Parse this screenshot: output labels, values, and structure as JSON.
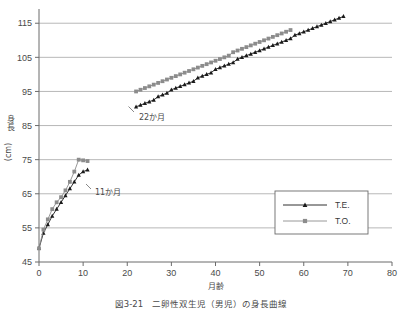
{
  "figure": {
    "caption": "図3-21　二卵性双生児（男児）の身長曲線",
    "annotations": [
      {
        "id": "a22",
        "text": "22か月"
      },
      {
        "id": "a11",
        "text": "11か月"
      }
    ]
  },
  "legend": {
    "position": "bottom-right",
    "items": [
      {
        "label": "T.E.",
        "marker": "triangle",
        "color": "#1a1a1a"
      },
      {
        "label": "T.O.",
        "marker": "square",
        "color": "#8c8c8c"
      }
    ]
  },
  "chart_data": {
    "type": "line",
    "title": "",
    "subtitle": "",
    "xlabel": "月齢",
    "ylabel": "身長（cm）",
    "ylabel_main": "身長",
    "ylabel_unit": "(cm)",
    "xlim": [
      0,
      80
    ],
    "ylim": [
      45,
      118
    ],
    "xticks": [
      0,
      10,
      20,
      30,
      40,
      50,
      60,
      70,
      80
    ],
    "xticklabels": [
      "0",
      "10",
      "20",
      "30",
      "40",
      "50",
      "60",
      "70",
      "80"
    ],
    "yticks": [
      45,
      55,
      65,
      75,
      85,
      95,
      105,
      115
    ],
    "yticklabels": [
      "45",
      "55",
      "65",
      "75",
      "85",
      "95",
      "105",
      "115"
    ],
    "grid": "horizontal",
    "legend_position": "lower right",
    "annotations": [
      {
        "text": "22か月",
        "x": 22,
        "y": 91,
        "note": "arrow points to start of second data block"
      },
      {
        "text": "11か月",
        "x": 11,
        "y": 72,
        "note": "arrow points to end of first data block"
      }
    ],
    "series": [
      {
        "name": "T.E.",
        "marker": "triangle",
        "color": "#1a1a1a",
        "points": [
          {
            "x": 0,
            "y": 49.0
          },
          {
            "x": 1,
            "y": 53.5
          },
          {
            "x": 2,
            "y": 56.0
          },
          {
            "x": 3,
            "y": 58.5
          },
          {
            "x": 4,
            "y": 60.5
          },
          {
            "x": 5,
            "y": 62.5
          },
          {
            "x": 6,
            "y": 64.5
          },
          {
            "x": 7,
            "y": 66.5
          },
          {
            "x": 8,
            "y": 68.5
          },
          {
            "x": 9,
            "y": 70.5
          },
          {
            "x": 10,
            "y": 71.5
          },
          {
            "x": 11,
            "y": 72.0
          },
          {
            "x": 22,
            "y": 90.5
          },
          {
            "x": 23,
            "y": 91.0
          },
          {
            "x": 24,
            "y": 91.5
          },
          {
            "x": 25,
            "y": 92.0
          },
          {
            "x": 26,
            "y": 92.5
          },
          {
            "x": 27,
            "y": 93.5
          },
          {
            "x": 28,
            "y": 94.0
          },
          {
            "x": 29,
            "y": 94.5
          },
          {
            "x": 30,
            "y": 95.5
          },
          {
            "x": 31,
            "y": 96.0
          },
          {
            "x": 32,
            "y": 96.5
          },
          {
            "x": 33,
            "y": 97.0
          },
          {
            "x": 34,
            "y": 97.5
          },
          {
            "x": 35,
            "y": 98.0
          },
          {
            "x": 36,
            "y": 99.0
          },
          {
            "x": 37,
            "y": 99.5
          },
          {
            "x": 38,
            "y": 100.0
          },
          {
            "x": 39,
            "y": 100.5
          },
          {
            "x": 40,
            "y": 101.5
          },
          {
            "x": 41,
            "y": 102.0
          },
          {
            "x": 42,
            "y": 102.5
          },
          {
            "x": 43,
            "y": 103.0
          },
          {
            "x": 44,
            "y": 103.5
          },
          {
            "x": 45,
            "y": 104.5
          },
          {
            "x": 46,
            "y": 105.0
          },
          {
            "x": 47,
            "y": 105.5
          },
          {
            "x": 48,
            "y": 106.0
          },
          {
            "x": 49,
            "y": 106.5
          },
          {
            "x": 50,
            "y": 107.0
          },
          {
            "x": 51,
            "y": 107.5
          },
          {
            "x": 52,
            "y": 108.0
          },
          {
            "x": 53,
            "y": 108.5
          },
          {
            "x": 54,
            "y": 109.0
          },
          {
            "x": 55,
            "y": 109.5
          },
          {
            "x": 56,
            "y": 110.0
          },
          {
            "x": 57,
            "y": 110.5
          },
          {
            "x": 58,
            "y": 111.5
          },
          {
            "x": 59,
            "y": 112.0
          },
          {
            "x": 60,
            "y": 112.5
          },
          {
            "x": 61,
            "y": 113.0
          },
          {
            "x": 62,
            "y": 113.5
          },
          {
            "x": 63,
            "y": 114.0
          },
          {
            "x": 64,
            "y": 114.5
          },
          {
            "x": 65,
            "y": 115.0
          },
          {
            "x": 66,
            "y": 115.5
          },
          {
            "x": 67,
            "y": 116.0
          },
          {
            "x": 68,
            "y": 116.5
          },
          {
            "x": 69,
            "y": 117.0
          }
        ]
      },
      {
        "name": "T.O.",
        "marker": "square",
        "color": "#8c8c8c",
        "points": [
          {
            "x": 0,
            "y": 49.0
          },
          {
            "x": 1,
            "y": 54.5
          },
          {
            "x": 2,
            "y": 57.5
          },
          {
            "x": 3,
            "y": 60.5
          },
          {
            "x": 4,
            "y": 62.5
          },
          {
            "x": 5,
            "y": 64.0
          },
          {
            "x": 6,
            "y": 66.0
          },
          {
            "x": 7,
            "y": 68.5
          },
          {
            "x": 8,
            "y": 71.5
          },
          {
            "x": 9,
            "y": 75.0
          },
          {
            "x": 10,
            "y": 74.8
          },
          {
            "x": 11,
            "y": 74.6
          },
          {
            "x": 22,
            "y": 95.0
          },
          {
            "x": 23,
            "y": 95.5
          },
          {
            "x": 24,
            "y": 96.0
          },
          {
            "x": 25,
            "y": 96.5
          },
          {
            "x": 26,
            "y": 97.0
          },
          {
            "x": 27,
            "y": 97.5
          },
          {
            "x": 28,
            "y": 98.0
          },
          {
            "x": 29,
            "y": 98.5
          },
          {
            "x": 30,
            "y": 99.0
          },
          {
            "x": 31,
            "y": 99.5
          },
          {
            "x": 32,
            "y": 100.0
          },
          {
            "x": 33,
            "y": 100.5
          },
          {
            "x": 34,
            "y": 101.0
          },
          {
            "x": 35,
            "y": 101.5
          },
          {
            "x": 36,
            "y": 102.0
          },
          {
            "x": 37,
            "y": 102.5
          },
          {
            "x": 38,
            "y": 103.0
          },
          {
            "x": 39,
            "y": 103.5
          },
          {
            "x": 40,
            "y": 104.0
          },
          {
            "x": 41,
            "y": 104.5
          },
          {
            "x": 42,
            "y": 105.0
          },
          {
            "x": 43,
            "y": 105.5
          },
          {
            "x": 44,
            "y": 106.5
          },
          {
            "x": 45,
            "y": 107.0
          },
          {
            "x": 46,
            "y": 107.5
          },
          {
            "x": 47,
            "y": 108.0
          },
          {
            "x": 48,
            "y": 108.5
          },
          {
            "x": 49,
            "y": 109.0
          },
          {
            "x": 50,
            "y": 109.5
          },
          {
            "x": 51,
            "y": 110.0
          },
          {
            "x": 52,
            "y": 110.5
          },
          {
            "x": 53,
            "y": 111.0
          },
          {
            "x": 54,
            "y": 111.5
          },
          {
            "x": 55,
            "y": 112.0
          },
          {
            "x": 56,
            "y": 112.5
          },
          {
            "x": 57,
            "y": 113.0
          }
        ]
      }
    ]
  }
}
